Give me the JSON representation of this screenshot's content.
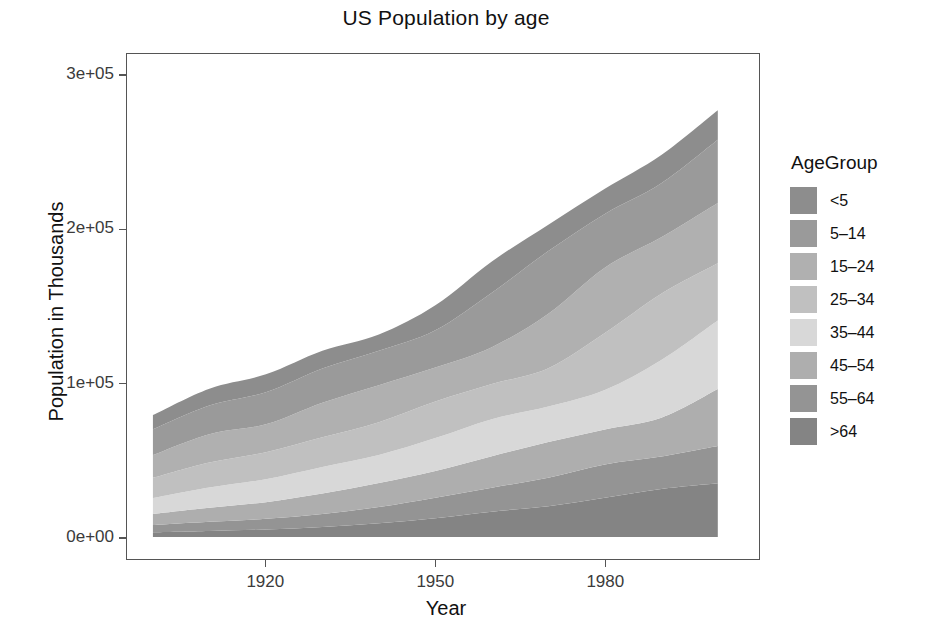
{
  "chart_data": {
    "type": "area",
    "title": "US Population by age",
    "xlabel": "Year",
    "ylabel": "Population in Thousands",
    "legend_title": "AgeGroup",
    "legend_position": "right",
    "grid": false,
    "stacked": true,
    "xlim": [
      1900,
      2002
    ],
    "ylim": [
      0,
      300000
    ],
    "xticks": [
      1920,
      1950,
      1980
    ],
    "xtick_labels": [
      "1920",
      "1950",
      "1980"
    ],
    "yticks": [
      0,
      100000,
      200000,
      300000
    ],
    "ytick_labels": [
      "0e+00",
      "1e+05",
      "2e+05",
      "3e+05"
    ],
    "x": [
      1900,
      1910,
      1920,
      1930,
      1940,
      1950,
      1960,
      1970,
      1980,
      1990,
      2000
    ],
    "stack_order_bottom_to_top": [
      ">64",
      "55-64",
      "45-54",
      "35-44",
      "25-34",
      "15-24",
      "5-14",
      "<5"
    ],
    "series": [
      {
        "name": "<5",
        "color": "#8d8d8d",
        "values": [
          9181,
          10905,
          11573,
          11444,
          10541,
          16164,
          20321,
          17166,
          16348,
          18354,
          19176
        ]
      },
      {
        "name": "5-14",
        "color": "#9a9a9a",
        "values": [
          16817,
          18692,
          20931,
          22343,
          22431,
          24319,
          35465,
          40733,
          34942,
          35095,
          41078
        ]
      },
      {
        "name": "15-24",
        "color": "#b0b0b0",
        "values": [
          14804,
          18398,
          18126,
          22498,
          24033,
          22098,
          24020,
          35441,
          42487,
          36680,
          39184
        ]
      },
      {
        "name": "25-34",
        "color": "#c0c0c0",
        "values": [
          13163,
          16319,
          17569,
          19227,
          21339,
          23759,
          22818,
          24907,
          37082,
          43176,
          37233
        ]
      },
      {
        "name": "35-44",
        "color": "#d8d8d8",
        "values": [
          10334,
          13127,
          14961,
          17344,
          18333,
          21450,
          24081,
          23088,
          25635,
          37579,
          44659
        ]
      },
      {
        "name": "45-54",
        "color": "#aeaeae",
        "values": [
          7261,
          9200,
          10784,
          13294,
          15512,
          17343,
          20485,
          23220,
          22800,
          25223,
          37030
        ]
      },
      {
        "name": "55-64",
        "color": "#949494",
        "values": [
          4718,
          5969,
          6991,
          8397,
          10572,
          13370,
          15572,
          18590,
          21703,
          21148,
          24275
        ]
      },
      {
        "name": ">64",
        "color": "#848484",
        "values": [
          3080,
          3950,
          4933,
          6634,
          9019,
          12270,
          16560,
          20066,
          25550,
          31242,
          34992
        ]
      }
    ]
  },
  "legend": {
    "title": "AgeGroup",
    "items": [
      {
        "label": "<5",
        "color": "#8d8d8d"
      },
      {
        "label": "5–14",
        "color": "#9a9a9a"
      },
      {
        "label": "15–24",
        "color": "#b0b0b0"
      },
      {
        "label": "25–34",
        "color": "#c0c0c0"
      },
      {
        "label": "35–44",
        "color": "#d8d8d8"
      },
      {
        "label": "45–54",
        "color": "#aeaeae"
      },
      {
        "label": "55–64",
        "color": "#949494"
      },
      {
        "label": ">64",
        "color": "#848484"
      }
    ]
  },
  "axes": {
    "y_title": "Population in Thousands",
    "x_title": "Year",
    "y_tick_labels": [
      "0e+00",
      "1e+05",
      "2e+05",
      "3e+05"
    ],
    "x_tick_labels": [
      "1920",
      "1950",
      "1980"
    ]
  },
  "title": "US Population by age",
  "theme": {
    "panel_border": "#555555",
    "text": "#111111",
    "tick_text": "#3b3b3b",
    "background": "#ffffff"
  }
}
